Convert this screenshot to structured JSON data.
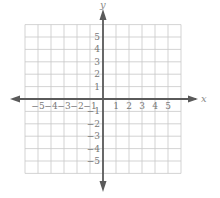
{
  "chart_data": {
    "type": "coordinate-grid",
    "title": "",
    "xlabel": "x",
    "ylabel": "y",
    "xlim": [
      -6,
      6
    ],
    "ylim": [
      -6,
      6
    ],
    "grid": true,
    "x_ticks": [
      "-5",
      "-4",
      "-3",
      "-2",
      "-1",
      "1",
      "2",
      "3",
      "4",
      "5"
    ],
    "y_ticks": [
      "5",
      "4",
      "3",
      "2",
      "1",
      "-1",
      "-2",
      "-3",
      "-4",
      "-5"
    ],
    "series": []
  },
  "labels": {
    "x_axis": "x",
    "y_axis": "y"
  },
  "colors": {
    "grid": "#c8c8c8",
    "axis": "#5a5a5a",
    "text": "#777777"
  }
}
